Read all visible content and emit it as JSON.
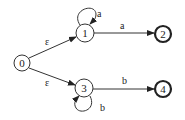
{
  "diagram": {
    "type": "finite-automaton",
    "nodes": [
      {
        "id": "0",
        "label": "0",
        "accepting": false
      },
      {
        "id": "1",
        "label": "1",
        "accepting": false
      },
      {
        "id": "2",
        "label": "2",
        "accepting": true
      },
      {
        "id": "3",
        "label": "3",
        "accepting": false
      },
      {
        "id": "4",
        "label": "4",
        "accepting": true
      }
    ],
    "edges": [
      {
        "from": "0",
        "to": "1",
        "label": "ε"
      },
      {
        "from": "0",
        "to": "3",
        "label": "ε"
      },
      {
        "from": "1",
        "to": "1",
        "label": "a"
      },
      {
        "from": "1",
        "to": "2",
        "label": "a"
      },
      {
        "from": "3",
        "to": "3",
        "label": "b"
      },
      {
        "from": "3",
        "to": "4",
        "label": "b"
      }
    ]
  }
}
